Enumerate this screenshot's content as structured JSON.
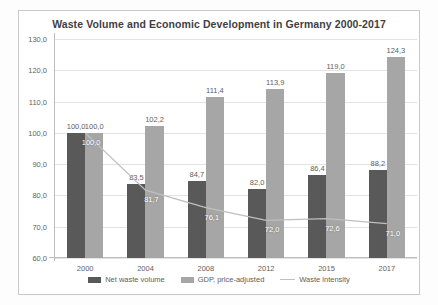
{
  "chart_data": {
    "type": "bar",
    "title": "Waste Volume and Economic Development in Germany 2000-2017",
    "xlabel": "",
    "ylabel": "",
    "ylim": [
      60.0,
      130.0
    ],
    "ytick_step": 10.0,
    "grid": true,
    "legend_position": "bottom",
    "decimal_separator": ",",
    "categories": [
      "2000",
      "2004",
      "2008",
      "2012",
      "2015",
      "2017"
    ],
    "ytick_labels": [
      "60,0",
      "70,0",
      "80,0",
      "90,0",
      "100,0",
      "110,0",
      "120,0",
      "130,0"
    ],
    "ytick_values": [
      60.0,
      70.0,
      80.0,
      90.0,
      100.0,
      110.0,
      120.0,
      130.0
    ],
    "series": [
      {
        "name": "Net waste volume",
        "type": "bar",
        "color": "#595959",
        "values": [
          100.0,
          83.5,
          84.7,
          82.0,
          86.4,
          88.2
        ],
        "labels": [
          "100,0",
          "83,5",
          "84,7",
          "82,0",
          "86,4",
          "88,2"
        ]
      },
      {
        "name": "GDP, price-adjusted",
        "type": "bar",
        "color": "#a6a6a6",
        "values": [
          100.0,
          102.2,
          111.4,
          113.9,
          119.0,
          124.3
        ],
        "labels": [
          "100,0",
          "102,2",
          "111,4",
          "113,9",
          "119,0",
          "124,3"
        ]
      },
      {
        "name": "Waste intensity",
        "type": "line",
        "color": "#bfbfbf",
        "values": [
          100.0,
          81.7,
          76.1,
          72.0,
          72.6,
          71.0
        ],
        "labels": [
          "100,0",
          "81,7",
          "76,1",
          "72,0",
          "72,6",
          "71,0"
        ]
      }
    ]
  },
  "legend": {
    "items": [
      {
        "label": "Net waste volume",
        "swatch": "net"
      },
      {
        "label": "GDP, price-adjusted",
        "swatch": "gdp"
      },
      {
        "label": "Waste intensity",
        "swatch": "line"
      }
    ]
  }
}
